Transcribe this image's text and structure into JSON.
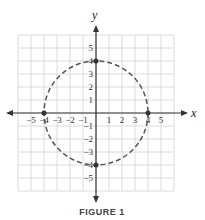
{
  "figure": {
    "caption": "FIGURE 1",
    "x_axis_label": "x",
    "y_axis_label": "y",
    "x_ticks": [
      "−5",
      "−4",
      "−3",
      "−2",
      "−1",
      "1",
      "2",
      "3",
      "4",
      "5"
    ],
    "y_ticks": [
      "5",
      "4",
      "3",
      "2",
      "1",
      "−1",
      "−2",
      "−3",
      "−4",
      "−5"
    ],
    "grid_range": [
      -6,
      6
    ],
    "circle": {
      "center": [
        0,
        0
      ],
      "radius": 4,
      "style": "dashed"
    },
    "points": [
      {
        "x": 0,
        "y": 4
      },
      {
        "x": 0,
        "y": -4
      },
      {
        "x": -4,
        "y": 0
      },
      {
        "x": 4,
        "y": 0
      }
    ],
    "colors": {
      "grid": "#d0d0d0",
      "axis": "#333333",
      "curve": "#555555"
    }
  }
}
